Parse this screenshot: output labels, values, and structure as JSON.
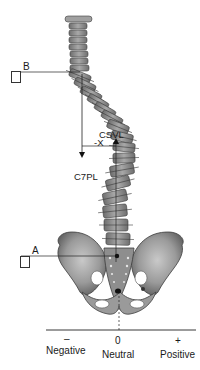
{
  "figure": {
    "colors": {
      "bone_fill": "#8a8a8a",
      "bone_dark": "#4a4a4a",
      "bone_light": "#bdbdbd",
      "line": "#222222",
      "background": "#ffffff"
    }
  },
  "labels": {
    "b": "B",
    "a": "A",
    "csvl": "CSVL",
    "x": "-X",
    "c7pl": "C7PL"
  },
  "axis": {
    "negative_sign": "–",
    "negative_label": "Negative",
    "neutral_sign": "0",
    "neutral_label": "Neutral",
    "positive_sign": "+",
    "positive_label": "Positive"
  }
}
